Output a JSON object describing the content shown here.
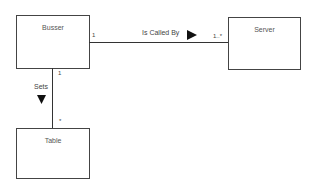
{
  "classes": {
    "busser": {
      "name": "Busser"
    },
    "server": {
      "name": "Server"
    },
    "table": {
      "name": "Table"
    }
  },
  "associations": [
    {
      "name": "Is Called By",
      "from": "Busser",
      "to": "Server",
      "from_multiplicity": "1",
      "to_multiplicity": "1..*",
      "direction_arrow": "right"
    },
    {
      "name": "Sets",
      "from": "Busser",
      "to": "Table",
      "from_multiplicity": "1",
      "to_multiplicity": "*",
      "direction_arrow": "down"
    }
  ]
}
